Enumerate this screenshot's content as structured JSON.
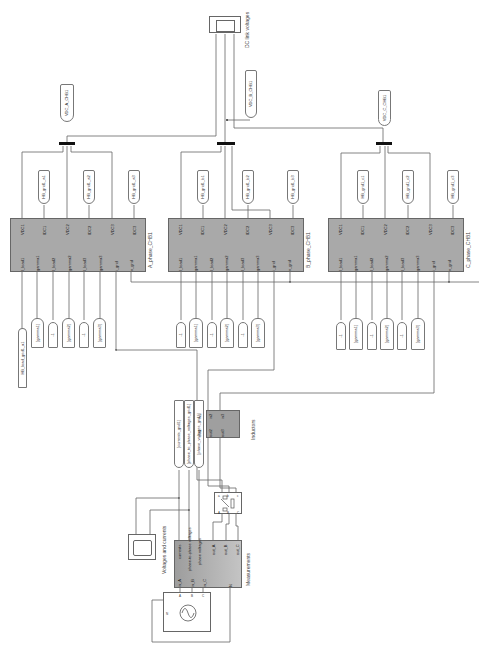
{
  "diagram": {
    "type": "simulink-model",
    "orientation": "rotated-90-ccw",
    "colors": {
      "block_fill": "#a9a9a9",
      "line": "#666666",
      "background": "#ffffff"
    }
  },
  "scopes": {
    "dc_link": {
      "label": "DC link voltages"
    },
    "voltages_currents": {
      "label": "Voltages and currents"
    }
  },
  "chb_blocks": [
    {
      "name": "A_phase_CHB1",
      "outputs": [
        "VDC1",
        "IDC1",
        "VDC2",
        "IDC2",
        "VDC3",
        "IDC3"
      ],
      "inputs": [
        "I_load1",
        "gamma1",
        "I_load2",
        "gamma2",
        "I_load3",
        "gamma3",
        "i_grid",
        "v_grid"
      ],
      "goto_idc": [
        "HB_grid1_a1",
        "HB_grid1_a2",
        "HB_grid1_a3"
      ],
      "goto_vdc": "VDC_A_CHB1",
      "from_inputs": [
        "HB_load_grid1_a1",
        "[gamma1]",
        "-1",
        "[gamma2]",
        "-1",
        "[gamma3]"
      ]
    },
    {
      "name": "B_phase_CHB1",
      "outputs": [
        "VDC1",
        "IDC1",
        "VDC2",
        "IDC2",
        "VDC3",
        "IDC3"
      ],
      "inputs": [
        "I_load1",
        "gamma1",
        "I_load2",
        "gamma2",
        "I_load3",
        "gamma3",
        "i_grid",
        "v_grid"
      ],
      "goto_idc": [
        "HB_grid1_b1",
        "HB_grid1_b2",
        "HB_grid1_b3"
      ],
      "goto_vdc": "VDC_B_CHB1",
      "from_inputs": [
        "-1",
        "[gamma1]",
        "-1",
        "[gamma2]",
        "-1",
        "[gamma3]"
      ]
    },
    {
      "name": "C_phase_CHB1",
      "outputs": [
        "VDC1",
        "IDC1",
        "VDC2",
        "IDC2",
        "VDC3",
        "IDC3"
      ],
      "inputs": [
        "I_load1",
        "gamma1",
        "I_load2",
        "gamma2",
        "I_load3",
        "gamma3",
        "i_grid",
        "v_grid"
      ],
      "goto_idc": [
        "HB_grid1_c1",
        "HB_grid1_c2",
        "HB_grid1_c3"
      ],
      "goto_vdc": "VDC_C_CHB1",
      "from_inputs": [
        "-1",
        "[gamma1]",
        "-1",
        "[gamma2]",
        "-1",
        "[gamma3]"
      ]
    }
  ],
  "inductors": {
    "label": "Inductors",
    "inputs": [
      "in1",
      "in2",
      "in3"
    ],
    "outputs": [
      "out1",
      "out2",
      "out3"
    ]
  },
  "goto_measure": [
    "[currents_grid1]",
    "[phase_to_phase_voltages_grid1]",
    "[phase_voltages_grid1]"
  ],
  "breaker": {
    "ports_top": [
      "a",
      "b",
      "c"
    ],
    "ports_bottom": [
      "A",
      "B",
      "C"
    ]
  },
  "measurements": {
    "label": "Measurements",
    "inputs": [
      "in_A",
      "in_B",
      "in_C",
      "N"
    ],
    "outputs": [
      "currents",
      "phase-to-phase voltages",
      "phase voltages",
      "out_A",
      "out_B",
      "out_C"
    ]
  },
  "source": {
    "ports": [
      "A",
      "B",
      "C",
      "N"
    ]
  }
}
